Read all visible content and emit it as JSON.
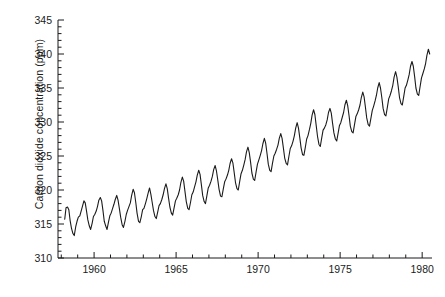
{
  "chart_data": {
    "type": "line",
    "title": "",
    "xlabel": "",
    "ylabel": "Carbon dioxide concentration (ppm)",
    "xlim": [
      1957.8,
      1980.6
    ],
    "ylim": [
      310,
      345
    ],
    "grid": false,
    "legend": "none",
    "x_ticks": [
      1960,
      1965,
      1970,
      1975,
      1980
    ],
    "x_tick_labels": [
      "1960",
      "1965",
      "1970",
      "1975",
      "1980"
    ],
    "x_minor_tick_interval": 1,
    "y_ticks": [
      310,
      315,
      320,
      325,
      330,
      335,
      340,
      345
    ],
    "y_tick_labels": [
      "310",
      "315",
      "320",
      "325",
      "330",
      "335",
      "340",
      "345"
    ],
    "y_minor_tick_interval": 1,
    "line_color": "#1b1b1b",
    "line_width": 1.1,
    "series": [
      {
        "name": "Mauna Loa atmospheric CO2 (monthly mean)",
        "x": [
          1958.21,
          1958.29,
          1958.38,
          1958.46,
          1958.54,
          1958.62,
          1958.71,
          1958.79,
          1958.88,
          1958.96,
          1959.04,
          1959.13,
          1959.21,
          1959.29,
          1959.38,
          1959.46,
          1959.54,
          1959.62,
          1959.71,
          1959.79,
          1959.88,
          1959.96,
          1960.04,
          1960.13,
          1960.21,
          1960.29,
          1960.38,
          1960.46,
          1960.54,
          1960.62,
          1960.71,
          1960.79,
          1960.88,
          1960.96,
          1961.04,
          1961.13,
          1961.21,
          1961.29,
          1961.38,
          1961.46,
          1961.54,
          1961.62,
          1961.71,
          1961.79,
          1961.88,
          1961.96,
          1962.04,
          1962.13,
          1962.21,
          1962.29,
          1962.38,
          1962.46,
          1962.54,
          1962.62,
          1962.71,
          1962.79,
          1962.88,
          1962.96,
          1963.04,
          1963.13,
          1963.21,
          1963.29,
          1963.38,
          1963.46,
          1963.54,
          1963.62,
          1963.71,
          1963.79,
          1963.88,
          1963.96,
          1964.04,
          1964.13,
          1964.21,
          1964.29,
          1964.38,
          1964.46,
          1964.54,
          1964.62,
          1964.71,
          1964.79,
          1964.88,
          1964.96,
          1965.04,
          1965.13,
          1965.21,
          1965.29,
          1965.38,
          1965.46,
          1965.54,
          1965.62,
          1965.71,
          1965.79,
          1965.88,
          1965.96,
          1966.04,
          1966.13,
          1966.21,
          1966.29,
          1966.38,
          1966.46,
          1966.54,
          1966.62,
          1966.71,
          1966.79,
          1966.88,
          1966.96,
          1967.04,
          1967.13,
          1967.21,
          1967.29,
          1967.38,
          1967.46,
          1967.54,
          1967.62,
          1967.71,
          1967.79,
          1967.88,
          1967.96,
          1968.04,
          1968.13,
          1968.21,
          1968.29,
          1968.38,
          1968.46,
          1968.54,
          1968.62,
          1968.71,
          1968.79,
          1968.88,
          1968.96,
          1969.04,
          1969.13,
          1969.21,
          1969.29,
          1969.38,
          1969.46,
          1969.54,
          1969.62,
          1969.71,
          1969.79,
          1969.88,
          1969.96,
          1970.04,
          1970.13,
          1970.21,
          1970.29,
          1970.38,
          1970.46,
          1970.54,
          1970.62,
          1970.71,
          1970.79,
          1970.88,
          1970.96,
          1971.04,
          1971.13,
          1971.21,
          1971.29,
          1971.38,
          1971.46,
          1971.54,
          1971.62,
          1971.71,
          1971.79,
          1971.88,
          1971.96,
          1972.04,
          1972.13,
          1972.21,
          1972.29,
          1972.38,
          1972.46,
          1972.54,
          1972.62,
          1972.71,
          1972.79,
          1972.88,
          1972.96,
          1973.04,
          1973.13,
          1973.21,
          1973.29,
          1973.38,
          1973.46,
          1973.54,
          1973.62,
          1973.71,
          1973.79,
          1973.88,
          1973.96,
          1974.04,
          1974.13,
          1974.21,
          1974.29,
          1974.38,
          1974.46,
          1974.54,
          1974.62,
          1974.71,
          1974.79,
          1974.88,
          1974.96,
          1975.04,
          1975.13,
          1975.21,
          1975.29,
          1975.38,
          1975.46,
          1975.54,
          1975.62,
          1975.71,
          1975.79,
          1975.88,
          1975.96,
          1976.04,
          1976.13,
          1976.21,
          1976.29,
          1976.38,
          1976.46,
          1976.54,
          1976.62,
          1976.71,
          1976.79,
          1976.88,
          1976.96,
          1977.04,
          1977.13,
          1977.21,
          1977.29,
          1977.38,
          1977.46,
          1977.54,
          1977.62,
          1977.71,
          1977.79,
          1977.88,
          1977.96,
          1978.04,
          1978.13,
          1978.21,
          1978.29,
          1978.38,
          1978.46,
          1978.54,
          1978.62,
          1978.71,
          1978.79,
          1978.88,
          1978.96,
          1979.04,
          1979.13,
          1979.21,
          1979.29,
          1979.38,
          1979.46,
          1979.54,
          1979.62,
          1979.71,
          1979.79,
          1979.88,
          1979.96,
          1980.04,
          1980.13,
          1980.21,
          1980.29,
          1980.38,
          1980.46
        ],
        "values": [
          315.7,
          317.4,
          317.5,
          317.1,
          315.5,
          314.4,
          313.6,
          313.3,
          314.6,
          315.4,
          316.0,
          316.2,
          316.9,
          317.6,
          318.4,
          318.1,
          316.9,
          315.6,
          314.7,
          314.2,
          315.1,
          316.1,
          316.4,
          316.9,
          317.6,
          318.5,
          318.9,
          318.4,
          317.0,
          315.4,
          314.7,
          314.2,
          315.3,
          316.2,
          316.6,
          317.3,
          317.9,
          318.6,
          319.2,
          318.5,
          317.3,
          316.0,
          314.9,
          314.5,
          315.4,
          316.4,
          317.0,
          317.6,
          318.1,
          319.2,
          320.1,
          319.6,
          318.2,
          316.6,
          315.4,
          315.2,
          316.1,
          317.1,
          317.3,
          318.0,
          318.7,
          319.5,
          320.3,
          319.4,
          318.2,
          317.0,
          316.1,
          315.8,
          316.8,
          317.7,
          318.0,
          318.6,
          319.3,
          320.2,
          320.9,
          320.2,
          318.8,
          317.5,
          316.6,
          316.3,
          317.4,
          318.4,
          318.8,
          319.3,
          320.0,
          321.1,
          321.9,
          321.3,
          319.8,
          318.3,
          317.3,
          317.1,
          318.2,
          319.3,
          319.7,
          320.5,
          321.2,
          322.2,
          322.9,
          322.3,
          320.8,
          319.2,
          318.3,
          318.0,
          319.2,
          320.3,
          320.7,
          321.3,
          322.0,
          323.0,
          323.6,
          322.8,
          321.5,
          320.1,
          319.1,
          319.0,
          320.2,
          321.2,
          321.6,
          322.2,
          322.9,
          323.9,
          324.6,
          324.0,
          322.6,
          321.1,
          320.2,
          320.0,
          321.3,
          322.4,
          322.9,
          323.7,
          324.5,
          325.6,
          326.3,
          325.5,
          324.1,
          322.5,
          321.6,
          321.4,
          322.7,
          323.8,
          324.4,
          325.1,
          325.8,
          326.8,
          327.6,
          326.9,
          325.4,
          323.8,
          322.9,
          322.7,
          324.0,
          325.0,
          325.4,
          326.0,
          326.6,
          327.6,
          328.3,
          327.6,
          326.2,
          324.7,
          323.9,
          323.7,
          325.0,
          326.1,
          326.5,
          327.2,
          328.0,
          329.1,
          329.9,
          329.1,
          327.7,
          326.2,
          325.2,
          325.1,
          326.3,
          327.5,
          328.0,
          328.9,
          329.8,
          331.0,
          331.8,
          331.1,
          329.5,
          327.9,
          326.7,
          326.4,
          327.7,
          328.8,
          329.1,
          329.6,
          330.3,
          331.4,
          332.0,
          331.3,
          329.8,
          328.4,
          327.5,
          327.2,
          328.4,
          329.5,
          329.9,
          330.7,
          331.4,
          332.5,
          333.2,
          332.4,
          331.0,
          329.4,
          328.6,
          328.4,
          329.7,
          330.8,
          331.2,
          331.8,
          332.5,
          333.6,
          334.4,
          333.7,
          332.2,
          330.6,
          329.6,
          329.4,
          330.6,
          331.7,
          332.3,
          333.1,
          333.9,
          335.0,
          335.8,
          335.0,
          333.6,
          332.0,
          331.1,
          330.9,
          332.2,
          333.4,
          333.9,
          334.6,
          335.4,
          336.6,
          337.4,
          336.6,
          335.2,
          333.6,
          332.7,
          332.5,
          333.8,
          335.0,
          335.4,
          336.2,
          337.0,
          338.2,
          338.9,
          338.2,
          336.7,
          335.0,
          334.1,
          333.9,
          335.3,
          336.5,
          337.1,
          337.8,
          338.6,
          339.8,
          340.7,
          340.0
        ]
      }
    ]
  }
}
